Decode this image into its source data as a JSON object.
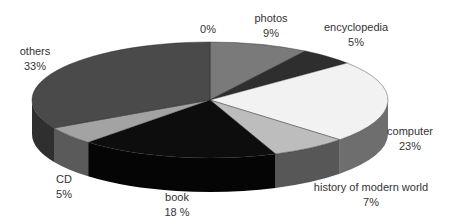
{
  "chart_data": {
    "type": "pie",
    "style": "3d",
    "title": "",
    "categories": [
      "photos",
      "encyclopedia",
      "computer",
      "history of modern world",
      "book",
      "CD",
      "others",
      ""
    ],
    "values": [
      9,
      5,
      23,
      7,
      18,
      5,
      33,
      0
    ],
    "labels": [
      {
        "name": "photos",
        "pct": "9%"
      },
      {
        "name": "encyclopedia",
        "pct": "5%"
      },
      {
        "name": "computer",
        "pct": "23%"
      },
      {
        "name": "history of modern world",
        "pct": "7%"
      },
      {
        "name": "book",
        "pct": "18 %"
      },
      {
        "name": "CD",
        "pct": "5%"
      },
      {
        "name": "others",
        "pct": "33%"
      },
      {
        "name": "",
        "pct": "0%"
      }
    ],
    "colors": {
      "photos": "#7a7a7a",
      "encyclopedia": "#2e2e2e",
      "computer": "#f2f2f2",
      "history of modern world": "#bdbdbd",
      "book": "#0d0d0d",
      "CD": "#a3a3a3",
      "others": "#4a4a4a"
    },
    "side_colors": {
      "photos": "#5f5f5f",
      "encyclopedia": "#1e1e1e",
      "computer": "#6e6e6e",
      "history of modern world": "#575757",
      "book": "#050505",
      "CD": "#5a5a5a",
      "others": "#2f2f2f"
    },
    "legend": "none",
    "start_angle": "12 o'clock, clockwise"
  }
}
